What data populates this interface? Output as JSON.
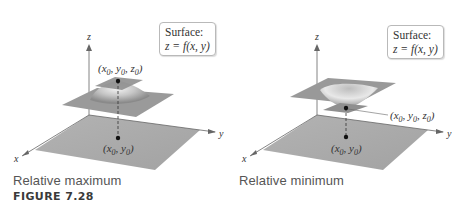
{
  "figure": {
    "label": "FIGURE 7.28",
    "panels": [
      {
        "caption": "Relative maximum",
        "surface_box": {
          "title": "Surface:",
          "equation": "z = f(x, y)"
        },
        "axes": {
          "x": "x",
          "y": "y",
          "z": "z"
        },
        "point_3d": "(x0, y0, z0)",
        "point_2d": "(x0, y0)",
        "type": "maximum"
      },
      {
        "caption": "Relative minimum",
        "surface_box": {
          "title": "Surface:",
          "equation": "z = f(x, y)"
        },
        "axes": {
          "x": "x",
          "y": "y",
          "z": "z"
        },
        "point_3d": "(x0, y0, z0)",
        "point_2d": "(x0, y0)",
        "type": "minimum"
      }
    ]
  },
  "colors": {
    "plane": "#a9a9a9",
    "surface": "#8c8c8c",
    "text": "#333333",
    "caption": "#555555"
  }
}
